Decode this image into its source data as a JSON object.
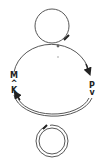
{
  "diagram": {
    "type": "cycle-diagram",
    "nodes": [
      {
        "id": "M",
        "label": "M"
      },
      {
        "id": "K",
        "label": "K"
      },
      {
        "id": "P",
        "label": "P"
      }
    ],
    "symbols": {
      "left_arrow": "^",
      "right_arrow": "v"
    },
    "loops": [
      {
        "name": "top-loop",
        "style": "single-line"
      },
      {
        "name": "main-cycle",
        "style": "single-line-top, double-line-bottom"
      },
      {
        "name": "bottom-loop",
        "style": "double-line"
      }
    ],
    "colors": {
      "line": "#333333",
      "background": "#ffffff"
    }
  }
}
